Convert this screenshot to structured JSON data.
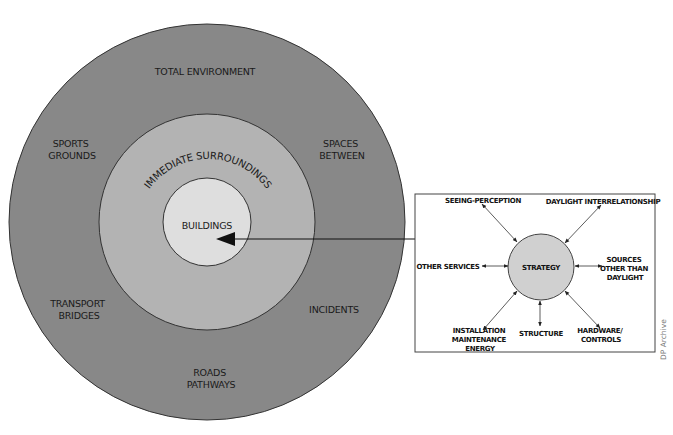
{
  "colors": {
    "outer_ring": "#888888",
    "middle_ring": "#b3b3b3",
    "inner_circle": "#dedede",
    "strategy_circle": "#d0d0d0",
    "stroke": "#333333",
    "text": "#1a1a1a"
  },
  "rings": {
    "outer": {
      "title": "TOTAL ENVIRONMENT",
      "labels": [
        {
          "id": "sports-grounds",
          "lines": [
            "SPORTS",
            "GROUNDS"
          ]
        },
        {
          "id": "spaces-between",
          "lines": [
            "SPACES",
            "BETWEEN"
          ]
        },
        {
          "id": "transport-bridges",
          "lines": [
            "TRANSPORT",
            "BRIDGES"
          ]
        },
        {
          "id": "incidents",
          "lines": [
            "INCIDENTS"
          ]
        },
        {
          "id": "roads-pathways",
          "lines": [
            "ROADS",
            "PATHWAYS"
          ]
        }
      ]
    },
    "middle": {
      "title": "IMMEDIATE SURROUNDINGS"
    },
    "inner": {
      "title": "BUILDINGS"
    }
  },
  "strategy_box": {
    "center_label": "STRATEGY",
    "nodes": [
      {
        "id": "seeing-perception",
        "lines": [
          "SEEING-PERCEPTION"
        ]
      },
      {
        "id": "daylight-interrelationship",
        "lines": [
          "DAYLIGHT INTERRELATIONSHIP"
        ]
      },
      {
        "id": "other-services",
        "lines": [
          "OTHER SERVICES"
        ]
      },
      {
        "id": "sources-other-than-daylight",
        "lines": [
          "SOURCES",
          "OTHER THAN",
          "DAYLIGHT"
        ]
      },
      {
        "id": "installation-maintenance-energy",
        "lines": [
          "INSTALLATION",
          "MAINTENANCE",
          "ENERGY"
        ]
      },
      {
        "id": "structure",
        "lines": [
          "STRUCTURE"
        ]
      },
      {
        "id": "hardware-controls",
        "lines": [
          "HARDWARE/",
          "CONTROLS"
        ]
      }
    ]
  },
  "credit": "DP Archive"
}
